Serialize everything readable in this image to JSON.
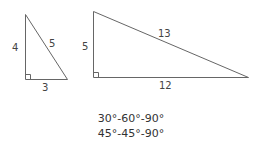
{
  "diagram": {
    "small_triangle": {
      "leg_vertical": "4",
      "hypotenuse": "5",
      "leg_horizontal": "3"
    },
    "large_triangle": {
      "leg_vertical": "5",
      "hypotenuse": "13",
      "leg_horizontal": "12"
    },
    "captions": [
      "30°-60°-90°",
      "45°-45°-90°"
    ],
    "colors": {
      "stroke": "#666666",
      "text": "#444444"
    }
  }
}
